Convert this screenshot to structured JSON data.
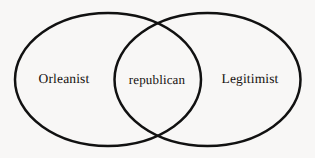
{
  "figure": {
    "type": "venn-diagram",
    "sets_count": 2,
    "background_color": "#f8f7f6",
    "stroke_color": "#111111",
    "stroke_width": 2.5,
    "fill": "none",
    "width": 315,
    "height": 158
  },
  "sets": {
    "left": {
      "label": "Orleanist",
      "center_x": 108,
      "center_y": 79.5,
      "radius_x": 93,
      "radius_y": 66.5
    },
    "right": {
      "label": "Legitimist",
      "center_x": 207.5,
      "center_y": 79.5,
      "radius_x": 93,
      "radius_y": 66.5
    }
  },
  "intersection": {
    "label": "republican",
    "center_x": 157,
    "center_y": 79.5,
    "crossing_top_x": 157,
    "crossing_top_y": 18,
    "crossing_bottom_x": 157,
    "crossing_bottom_y": 141
  },
  "labels": {
    "left": "Orleanist",
    "center": "republican",
    "right": "Legitimist"
  }
}
